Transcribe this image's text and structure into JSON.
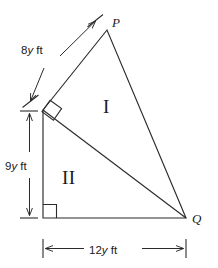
{
  "figure": {
    "type": "geometry-diagram",
    "background_color": "#ffffff",
    "stroke_color": "#2b2b2b",
    "vertices": [
      {
        "name": "P",
        "label": "P",
        "x": 107,
        "y": 30
      },
      {
        "name": "Q",
        "label": "Q",
        "x": 186,
        "y": 218
      },
      {
        "name": "left-upper",
        "label": "",
        "x": 43,
        "y": 110
      },
      {
        "name": "bottom-left",
        "label": "",
        "x": 43,
        "y": 218
      }
    ],
    "regions": [
      {
        "id": "I",
        "label": "I",
        "x": 103,
        "y": 97
      },
      {
        "id": "II",
        "label": "II",
        "x": 62,
        "y": 168
      }
    ],
    "dimensions": [
      {
        "id": "side-8y",
        "value": "8",
        "variable": "y",
        "unit": "ft",
        "text": "8y ft",
        "orientation": "diagonal",
        "measures": "segment from left-upper vertex to P"
      },
      {
        "id": "side-9y",
        "value": "9",
        "variable": "y",
        "unit": "ft",
        "text": "9y ft",
        "orientation": "vertical",
        "measures": "segment from left-upper vertex to bottom-left vertex"
      },
      {
        "id": "side-12y",
        "value": "12",
        "variable": "y",
        "unit": "ft",
        "text": "12y ft",
        "orientation": "horizontal",
        "measures": "segment from bottom-left vertex to Q"
      }
    ],
    "right_angles": [
      {
        "id": "right-angle-upper",
        "at": "left-upper",
        "style": "rotated-square"
      },
      {
        "id": "right-angle-lower",
        "at": "bottom-left",
        "style": "square"
      }
    ]
  }
}
